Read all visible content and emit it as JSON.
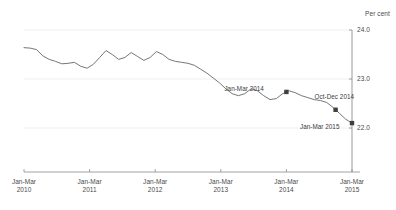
{
  "chart_data": {
    "type": "line",
    "title": "",
    "subtitle": "",
    "xlabel": "",
    "ylabel": "",
    "unit_label": "Per cent",
    "ylim": [
      21.0,
      24.0
    ],
    "yticks": [
      24.0,
      23.0,
      22.0
    ],
    "ytick_labels": [
      "24.0",
      "23.0",
      "22.0"
    ],
    "y_axis_position": "right",
    "grid": true,
    "grid_axis": "y",
    "legend": false,
    "legend_position": "none",
    "xtick_labels": [
      {
        "line1": "Jan-Mar",
        "line2": "2010"
      },
      {
        "line1": "Jan-Mar",
        "line2": "2011"
      },
      {
        "line1": "Jan-Mar",
        "line2": "2012"
      },
      {
        "line1": "Jan-Mar",
        "line2": "2013"
      },
      {
        "line1": "Jan-Mar",
        "line2": "2014"
      },
      {
        "line1": "Jan-Mar",
        "line2": "2015"
      }
    ],
    "x": [
      "Jan-Mar 2010",
      "Apr-Jun 2010",
      "Jul-Sep 2010",
      "Oct-Dec 2010",
      "Jan-Mar 2011",
      "Apr-Jun 2011",
      "Jul-Sep 2011",
      "Oct-Dec 2011",
      "Jan-Mar 2012",
      "Apr-Jun 2012",
      "Jul-Sep 2012",
      "Oct-Dec 2012",
      "Jan-Mar 2013",
      "Apr-Jun 2013",
      "Jul-Sep 2013",
      "Oct-Dec 2013",
      "Jan-Mar 2014",
      "Apr-Jun 2014",
      "Jul-Sep 2014",
      "Oct-Dec 2014",
      "Jan-Mar 2015"
    ],
    "values": [
      23.64,
      23.62,
      23.4,
      23.32,
      23.34,
      23.3,
      23.58,
      23.4,
      23.54,
      23.38,
      23.56,
      23.36,
      23.32,
      23.2,
      23.16,
      23.06,
      22.96,
      22.64,
      22.56,
      22.42,
      22.1
    ],
    "series": [
      {
        "name": "Per cent",
        "color": "#666666",
        "values": [
          23.64,
          23.62,
          23.4,
          23.32,
          23.34,
          23.3,
          23.58,
          23.4,
          23.54,
          23.38,
          23.56,
          23.36,
          23.32,
          23.2,
          23.16,
          23.06,
          22.96,
          22.64,
          22.56,
          22.42,
          22.1
        ]
      }
    ],
    "dense_values": [
      23.64,
      23.63,
      23.6,
      23.47,
      23.4,
      23.36,
      23.31,
      23.32,
      23.34,
      23.26,
      23.22,
      23.3,
      23.44,
      23.58,
      23.5,
      23.4,
      23.44,
      23.54,
      23.46,
      23.38,
      23.44,
      23.56,
      23.5,
      23.4,
      23.36,
      23.34,
      23.32,
      23.28,
      23.2,
      23.12,
      23.02,
      22.92,
      22.8,
      22.7,
      22.66,
      22.7,
      22.8,
      22.76,
      22.66,
      22.58,
      22.6,
      22.7,
      22.76,
      22.72,
      22.66,
      22.62,
      22.58,
      22.56,
      22.52,
      22.42,
      22.3,
      22.18,
      22.1
    ],
    "annotations": [
      {
        "label": "Jan-Mar 2014",
        "x": "Jan-Mar 2014",
        "value": 22.42,
        "marker": "square"
      },
      {
        "label": "Oct-Dec 2014",
        "x": "Oct-Dec 2014",
        "value": 22.6,
        "marker": "square"
      },
      {
        "label": "Jan-Mar 2015",
        "x": "Jan-Mar 2015",
        "value": 22.4,
        "marker": "square"
      }
    ],
    "marker_color": "#3f3f3f",
    "axis_color": "#8a8a8a",
    "grid_color": "#efefef"
  }
}
